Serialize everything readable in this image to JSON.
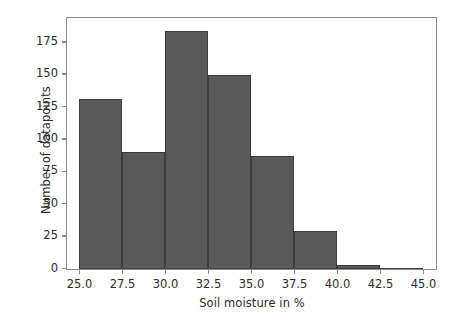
{
  "chart_data": {
    "type": "bar",
    "title": "",
    "xlabel": "Soil moisture in %",
    "ylabel": "Number of datapoints",
    "categories": [
      "25.0-27.5",
      "27.5-30.0",
      "30.0-32.5",
      "32.5-35.0",
      "35.0-37.5",
      "37.5-40.0",
      "40.0-42.5",
      "42.5-45.0"
    ],
    "bin_edges": [
      25.0,
      27.5,
      30.0,
      32.5,
      35.0,
      37.5,
      40.0,
      42.5,
      45.0
    ],
    "bin_width": 2.5,
    "values": [
      131,
      90,
      184,
      150,
      87,
      29,
      3,
      0
    ],
    "xlim": [
      24.3,
      45.7
    ],
    "ylim": [
      0,
      193
    ],
    "xticks": [
      25.0,
      27.5,
      30.0,
      32.5,
      35.0,
      37.5,
      40.0,
      42.5,
      45.0
    ],
    "xtick_labels": [
      "25.0",
      "27.5",
      "30.0",
      "32.5",
      "35.0",
      "37.5",
      "40.0",
      "42.5",
      "45.0"
    ],
    "yticks": [
      0,
      25,
      50,
      75,
      100,
      125,
      150,
      175
    ],
    "ytick_labels": [
      "0",
      "25",
      "50",
      "75",
      "100",
      "125",
      "150",
      "175"
    ],
    "grid": false,
    "legend": null,
    "colors": {
      "bar_fill": "#595959",
      "bar_edge": "#3d3d3d",
      "frame": "#8a8a8a",
      "text": "#2b2b2b",
      "background": "#ffffff"
    }
  }
}
